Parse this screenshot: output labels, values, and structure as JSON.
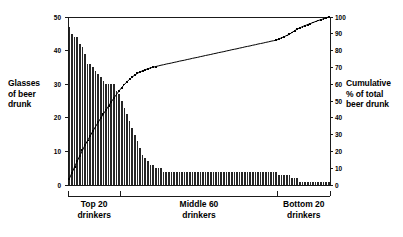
{
  "chart_data": {
    "type": "bar",
    "title": "",
    "subtitle": "",
    "xlabel": "",
    "ylabel": "Glasses of beer drunk",
    "y2label": "Cumulative % of total beer drunk",
    "ylim": [
      0,
      50
    ],
    "y2lim": [
      0,
      100
    ],
    "grid": false,
    "legend_position": "none",
    "y_ticks": [
      "0",
      "10",
      "20",
      "30",
      "40",
      "50"
    ],
    "y_tick_values": [
      0,
      10,
      20,
      30,
      40,
      50
    ],
    "y2_ticks": [
      "0",
      "10",
      "20",
      "30",
      "40",
      "50",
      "60",
      "70",
      "80",
      "90",
      "100"
    ],
    "y2_tick_values": [
      0,
      10,
      20,
      30,
      40,
      50,
      60,
      70,
      80,
      90,
      100
    ],
    "categories": [
      "1",
      "2",
      "3",
      "4",
      "5",
      "6",
      "7",
      "8",
      "9",
      "10",
      "11",
      "12",
      "13",
      "14",
      "15",
      "16",
      "17",
      "18",
      "19",
      "20",
      "21",
      "22",
      "23",
      "24",
      "25",
      "26",
      "27",
      "28",
      "29",
      "30",
      "31",
      "32",
      "33",
      "34",
      "35",
      "36",
      "37",
      "38",
      "39",
      "40",
      "41",
      "42",
      "43",
      "44",
      "45",
      "46",
      "47",
      "48",
      "49",
      "50",
      "51",
      "52",
      "53",
      "54",
      "55",
      "56",
      "57",
      "58",
      "59",
      "60",
      "61",
      "62",
      "63",
      "64",
      "65",
      "66",
      "67",
      "68",
      "69",
      "70",
      "71",
      "72",
      "73",
      "74",
      "75",
      "76",
      "77",
      "78",
      "79",
      "80",
      "81",
      "82",
      "83",
      "84",
      "85",
      "86",
      "87",
      "88",
      "89",
      "90",
      "91",
      "92",
      "93",
      "94",
      "95",
      "96",
      "97",
      "98",
      "99",
      "100"
    ],
    "series": [
      {
        "name": "Glasses of beer drunk",
        "axis": "left",
        "kind": "bar",
        "color": "#262626",
        "values": [
          47,
          45,
          44,
          44,
          42,
          41,
          39,
          36,
          36,
          35,
          34,
          33,
          32,
          31,
          30,
          30,
          30,
          30,
          28,
          27,
          25,
          23,
          21,
          19,
          17,
          15,
          13,
          11,
          9,
          8,
          7,
          6,
          6,
          5,
          5,
          5,
          4,
          4,
          4,
          4,
          4,
          4,
          4,
          4,
          4,
          4,
          4,
          4,
          4,
          4,
          4,
          4,
          4,
          4,
          4,
          4,
          4,
          4,
          4,
          4,
          4,
          4,
          4,
          4,
          4,
          4,
          4,
          4,
          4,
          4,
          4,
          4,
          4,
          4,
          4,
          4,
          4,
          4,
          4,
          4,
          3,
          3,
          3,
          3,
          3,
          2,
          2,
          2,
          1,
          1,
          1,
          1,
          1,
          1,
          1,
          1,
          1,
          1,
          1,
          1
        ]
      },
      {
        "name": "Cumulative % of total beer drunk",
        "axis": "right",
        "kind": "line",
        "color": "#000000",
        "marker": "square",
        "values": [
          3.7,
          7.2,
          10.7,
          14.1,
          17.4,
          20.6,
          23.7,
          26.5,
          29.3,
          32.1,
          34.7,
          37.3,
          39.8,
          42.3,
          44.6,
          47.0,
          49.4,
          51.7,
          53.9,
          56.0,
          58.0,
          59.8,
          61.4,
          62.9,
          64.3,
          65.4,
          66.5,
          67.3,
          68.0,
          68.6,
          69.2,
          69.7,
          70.1,
          70.5,
          70.9,
          71.3,
          71.6,
          72.0,
          72.3,
          72.6,
          73.0,
          73.3,
          73.7,
          74.0,
          74.3,
          74.7,
          75.0,
          75.4,
          75.7,
          76.0,
          76.4,
          76.7,
          77.1,
          77.4,
          77.7,
          78.1,
          78.4,
          78.8,
          79.1,
          79.4,
          79.8,
          80.1,
          80.5,
          80.8,
          81.1,
          81.5,
          81.8,
          82.2,
          82.5,
          82.8,
          83.2,
          83.5,
          83.9,
          84.2,
          84.5,
          84.9,
          85.2,
          85.6,
          85.9,
          86.2,
          86.9,
          87.6,
          88.3,
          89.0,
          89.7,
          90.8,
          91.8,
          92.8,
          93.6,
          94.3,
          94.9,
          95.5,
          96.1,
          96.7,
          97.3,
          97.9,
          98.4,
          98.9,
          99.5,
          100.0
        ]
      }
    ],
    "groups": [
      {
        "key": "top20",
        "label": "Top 20\ndrinkers",
        "start": 1,
        "end": 20
      },
      {
        "key": "middle60",
        "label": "Middle 60\ndrinkers",
        "start": 21,
        "end": 80
      },
      {
        "key": "bottom20",
        "label": "Bottom 20\ndrinkers",
        "start": 81,
        "end": 100
      }
    ],
    "annotations": []
  },
  "axes": {
    "left_title": "Glasses\nof beer\ndrunk",
    "right_title": "Cumulative\n% of total\nbeer drunk"
  },
  "colors": {
    "bar": "#262626",
    "line": "#000000",
    "axis": "#1a1a1a",
    "background": "#ffffff"
  }
}
